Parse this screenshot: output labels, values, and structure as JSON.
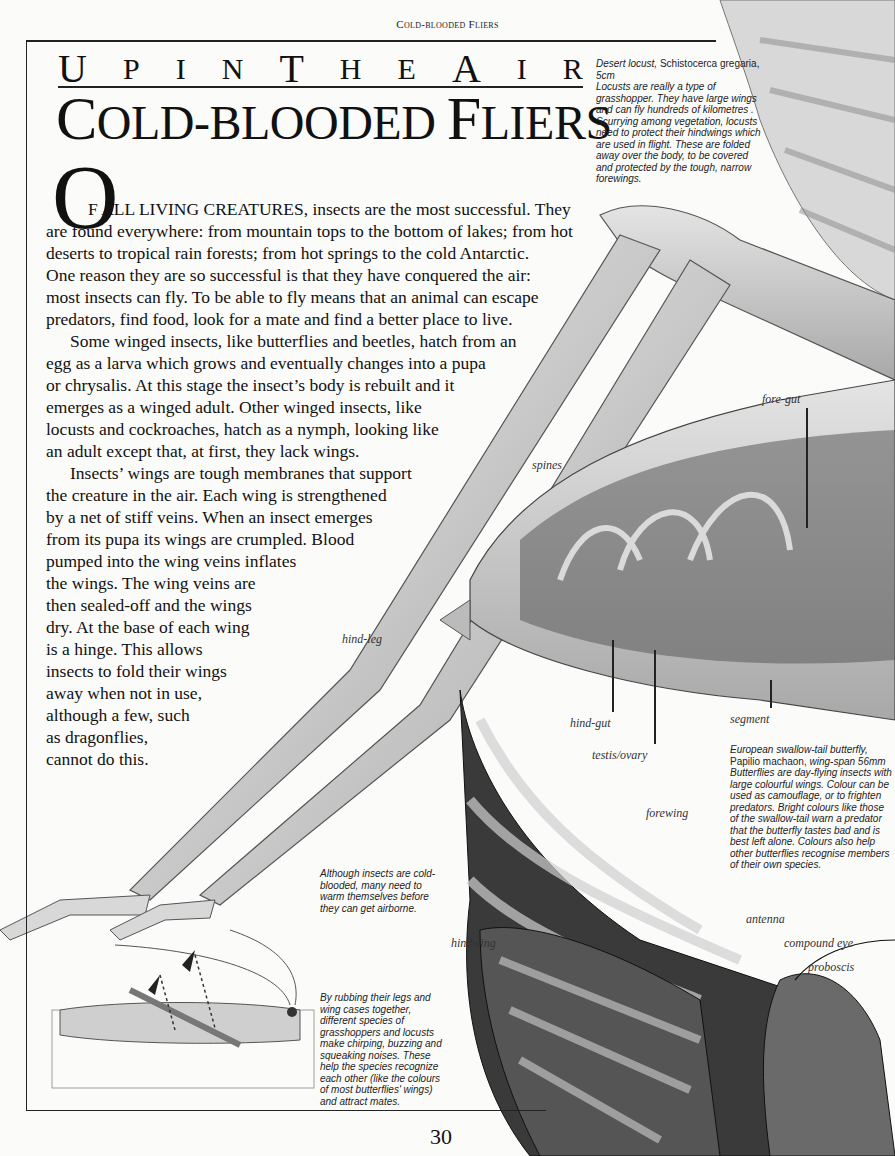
{
  "running_head": "Cold-blooded Fliers",
  "kicker": [
    "U",
    "P",
    "I",
    "N",
    "T",
    "H",
    "E",
    "A",
    "I",
    "R"
  ],
  "kicker_text": "Up in the Air",
  "title": {
    "first_cap": "C",
    "rest_1": "OLD-BLOODED ",
    "second_cap": "F",
    "rest_2": "LIERS",
    "full": "Cold-blooded Fliers"
  },
  "intro": {
    "drop_cap": "O",
    "lines": [
      "F ALL LIVING CREATURES, insects are the most successful. They",
      "are found everywhere: from mountain tops to the bottom of lakes; from hot",
      "deserts to tropical rain forests;  from hot springs to the cold Antarctic.",
      "One reason they are so successful is that they have conquered the air:",
      "most insects can fly. To be able to fly means that an animal can escape",
      "predators, find food, look for a mate and find a better place to live."
    ]
  },
  "paragraph2": [
    "Some winged insects, like butterflies and beetles, hatch from an",
    "egg as a larva which grows and eventually changes into a pupa",
    "or chrysalis. At this stage the insect’s body is rebuilt and it",
    "emerges as a winged adult. Other winged insects, like",
    "locusts and cockroaches, hatch as a nymph, looking like",
    "an adult except that, at first, they lack wings."
  ],
  "paragraph3": [
    "Insects’ wings are tough membranes that support",
    "the creature in the air. Each wing is strengthened",
    "by a net of stiff veins. When an insect emerges",
    "from its pupa its wings are crumpled. Blood",
    "pumped into the wing veins inflates",
    "the wings. The wing veins are",
    "then sealed-off and the wings",
    "dry. At the base of each wing",
    "is a hinge. This allows",
    "insects to fold their wings",
    "away when not in use,",
    "although a few, such",
    "as dragonflies,",
    "cannot do this."
  ],
  "locust_caption": {
    "name": "Desert locust,",
    "species": " Schistocerca gregaria,",
    "size": " 5cm",
    "text": "Locusts are really a type of grasshopper. They have large wings and can fly hundreds of kilometres . Scurrying among vegetation, locusts need to protect their hindwings which are used in flight. These are folded away over the body, to be covered and protected by the tough, narrow forewings."
  },
  "butterfly_caption": {
    "name": "European swallow-tail butterfly,",
    "species": " Papilio machaon,",
    "size": " wing-span 56mm",
    "text": "Butterflies are day-flying insects with large colourful wings. Colour can be used as camouflage, or to frighten predators. Bright colours like those of the swallow-tail warn a predator that the butterfly tastes bad and is best left alone. Colours also help other butterflies recognise members of their own species."
  },
  "warm_caption": "Although insects are cold-blooded, many need to warm themselves before they can get airborne.",
  "sound_caption": "By rubbing their legs and wing cases together, different species of grasshoppers and locusts make chirping, buzzing and squeaking noises. These help the species recognize each other (like the colours of most butterflies' wings) and attract mates.",
  "labels": {
    "fore_gut": "fore-gut",
    "spines": "spines",
    "hind_leg": "hind-leg",
    "hind_gut": "hind-gut",
    "testis_ovary": "testis/ovary",
    "segment": "segment",
    "forewing": "forewing",
    "hindwing": "hindwing",
    "antenna": "antenna",
    "compound_eye": "compound eye",
    "proboscis": "proboscis"
  },
  "page_number": "30"
}
